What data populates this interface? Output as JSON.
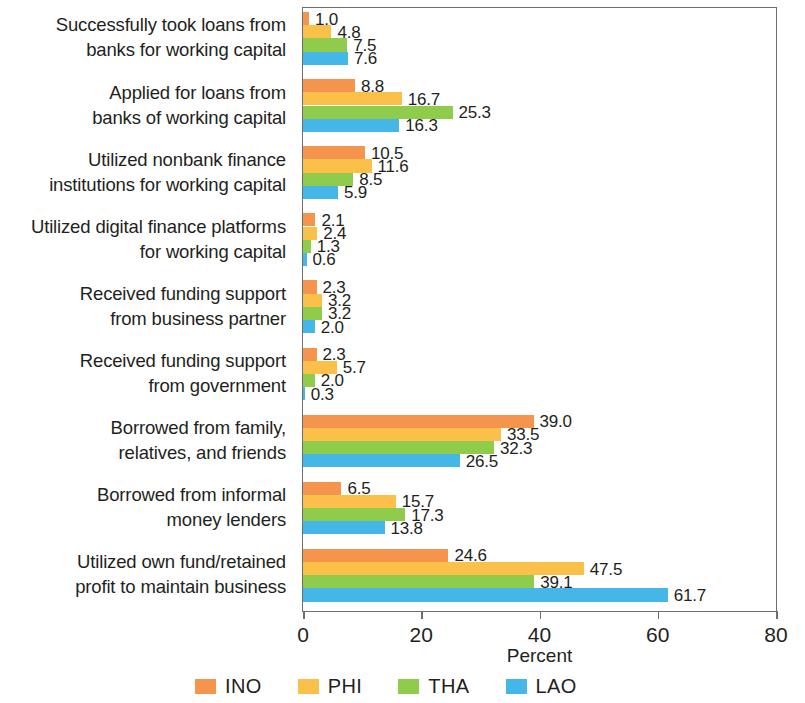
{
  "chart_data": {
    "type": "bar",
    "orientation": "horizontal",
    "title": "",
    "xlabel": "Percent",
    "ylabel": "",
    "xlim": [
      0,
      80
    ],
    "xticks": [
      "0",
      "20",
      "40",
      "60",
      "80"
    ],
    "grid": false,
    "legend_position": "bottom",
    "categories": [
      "Successfully took loans from banks for working capital",
      "Applied for loans from banks of working capital",
      "Utilized nonbank finance institutions for working capital",
      "Utilized digital finance platforms for working capital",
      "Received funding support from business partner",
      "Received funding support from government",
      "Borrowed from family, relatives, and friends",
      "Borrowed from informal money lenders",
      "Utilized own fund/retained profit to maintain business"
    ],
    "category_lines": [
      [
        "Successfully took loans from",
        "banks for working capital"
      ],
      [
        "Applied for loans from",
        "banks of working capital"
      ],
      [
        "Utilized nonbank finance",
        "institutions for working capital"
      ],
      [
        "Utilized digital finance platforms",
        "for working capital"
      ],
      [
        "Received funding support",
        "from business partner"
      ],
      [
        "Received funding support",
        "from government"
      ],
      [
        "Borrowed from family,",
        "relatives, and friends"
      ],
      [
        "Borrowed from informal",
        "money lenders"
      ],
      [
        "Utilized own fund/retained",
        "profit to maintain business"
      ]
    ],
    "series": [
      {
        "name": "INO",
        "color": "#F5944C",
        "values": [
          1.0,
          8.8,
          10.5,
          2.1,
          2.3,
          2.3,
          39.0,
          6.5,
          24.6
        ]
      },
      {
        "name": "PHI",
        "color": "#FBC04A",
        "values": [
          4.8,
          16.7,
          11.6,
          2.4,
          3.2,
          5.7,
          33.5,
          15.7,
          47.5
        ]
      },
      {
        "name": "THA",
        "color": "#90CC4C",
        "values": [
          7.5,
          25.3,
          8.5,
          1.3,
          3.2,
          2.0,
          32.3,
          17.3,
          39.1
        ]
      },
      {
        "name": "LAO",
        "color": "#45B6E8",
        "values": [
          7.6,
          16.3,
          5.9,
          0.6,
          2.0,
          0.3,
          26.5,
          13.8,
          61.7
        ]
      }
    ],
    "value_labels": [
      [
        "1.0",
        "4.8",
        "7.5",
        "7.6"
      ],
      [
        "8.8",
        "16.7",
        "25.3",
        "16.3"
      ],
      [
        "10.5",
        "11.6",
        "8.5",
        "5.9"
      ],
      [
        "2.1",
        "2.4",
        "1.3",
        "0.6"
      ],
      [
        "2.3",
        "3.2",
        "3.2",
        "2.0"
      ],
      [
        "2.3",
        "5.7",
        "2.0",
        "0.3"
      ],
      [
        "39.0",
        "33.5",
        "32.3",
        "26.5"
      ],
      [
        "6.5",
        "15.7",
        "17.3",
        "13.8"
      ],
      [
        "24.6",
        "47.5",
        "39.1",
        "61.7"
      ]
    ],
    "legend": [
      {
        "label": "INO",
        "color": "#F5944C"
      },
      {
        "label": "PHI",
        "color": "#FBC04A"
      },
      {
        "label": "THA",
        "color": "#90CC4C"
      },
      {
        "label": "LAO",
        "color": "#45B6E8"
      }
    ]
  }
}
